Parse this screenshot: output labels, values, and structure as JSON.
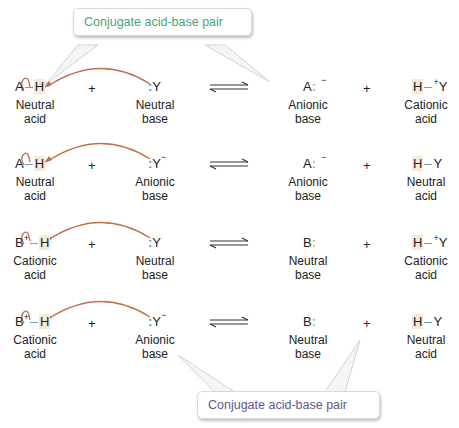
{
  "callouts": {
    "top": {
      "text": "Conjugate acid-base pair",
      "color": "#4aa37a"
    },
    "bottom": {
      "text": "Conjugate acid-base pair",
      "color": "#5b5a8c"
    }
  },
  "colors": {
    "arrow": "#c0704a",
    "base_dots": "#3d9bd6",
    "anion_dots": "#d9b24a",
    "highlight": "#f3ead9"
  },
  "rows": [
    {
      "acid": {
        "left": "A",
        "left_charge": "",
        "right": "H",
        "label1": "Neutral",
        "label2": "acid"
      },
      "plus": "+",
      "base": {
        "dots": ":",
        "charge": "",
        "atom": "Y",
        "label1": "Neutral",
        "label2": "base"
      },
      "product_base": {
        "atom": "A",
        "charge": "−",
        "dots": ":",
        "label1": "Anionic",
        "label2": "base"
      },
      "plus2": "+",
      "product_acid": {
        "left": "H",
        "charge": "+",
        "right": "Y",
        "label1": "Cationic",
        "label2": "acid"
      }
    },
    {
      "acid": {
        "left": "A",
        "left_charge": "",
        "right": "H",
        "label1": "Neutral",
        "label2": "acid"
      },
      "plus": "+",
      "base": {
        "dots": ":",
        "charge": "−",
        "atom": "Y",
        "label1": "Anionic",
        "label2": "base"
      },
      "product_base": {
        "atom": "A",
        "charge": "−",
        "dots": ":",
        "label1": "Anionic",
        "label2": "base"
      },
      "plus2": "+",
      "product_acid": {
        "left": "H",
        "charge": "",
        "right": "Y",
        "label1": "Neutral",
        "label2": "acid"
      }
    },
    {
      "acid": {
        "left": "B",
        "left_charge": "+",
        "right": "H",
        "label1": "Cationic",
        "label2": "acid"
      },
      "plus": "+",
      "base": {
        "dots": ":",
        "charge": "",
        "atom": "Y",
        "label1": "Neutral",
        "label2": "base"
      },
      "product_base": {
        "atom": "B",
        "charge": "",
        "dots": ":",
        "label1": "Neutral",
        "label2": "base"
      },
      "plus2": "+",
      "product_acid": {
        "left": "H",
        "charge": "+",
        "right": "Y",
        "label1": "Cationic",
        "label2": "acid"
      }
    },
    {
      "acid": {
        "left": "B",
        "left_charge": "+",
        "right": "H",
        "label1": "Cationic",
        "label2": "acid"
      },
      "plus": "+",
      "base": {
        "dots": ":",
        "charge": "−",
        "atom": "Y",
        "label1": "Anionic",
        "label2": "base"
      },
      "product_base": {
        "atom": "B",
        "charge": "",
        "dots": ":",
        "label1": "Neutral",
        "label2": "base"
      },
      "plus2": "+",
      "product_acid": {
        "left": "H",
        "charge": "",
        "right": "Y",
        "label1": "Neutral",
        "label2": "acid"
      }
    }
  ]
}
